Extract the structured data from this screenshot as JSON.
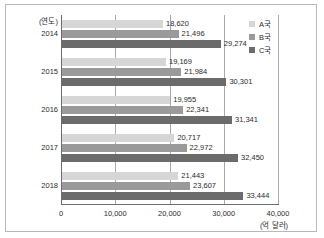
{
  "chart_data": {
    "type": "bar",
    "orientation": "horizontal",
    "title": "",
    "subtitle": "",
    "xlabel": "(억 달러)",
    "ylabel": "(연도)",
    "xlim": [
      0,
      40000
    ],
    "xticks": [
      "0",
      "10,000",
      "20,000",
      "30,000",
      "40,000"
    ],
    "xtick_values": [
      0,
      10000,
      20000,
      30000,
      40000
    ],
    "grid": true,
    "legend_position": "top-right",
    "categories": [
      "2014",
      "2015",
      "2016",
      "2017",
      "2018"
    ],
    "series": [
      {
        "name": "A국",
        "color": "#d6d6d6",
        "values": [
          18620,
          19169,
          19955,
          20717,
          21443
        ],
        "labels": [
          "18,620",
          "19,169",
          "19,955",
          "20,717",
          "21,443"
        ]
      },
      {
        "name": "B국",
        "color": "#9a9a9a",
        "values": [
          21496,
          21984,
          22341,
          22972,
          23607
        ],
        "labels": [
          "21,496",
          "21,984",
          "22,341",
          "22,972",
          "23,607"
        ]
      },
      {
        "name": "C국",
        "color": "#6b6b6b",
        "values": [
          29274,
          30301,
          31341,
          32450,
          33444
        ],
        "labels": [
          "29,274",
          "30,301",
          "31,341",
          "32,450",
          "33,444"
        ]
      }
    ]
  },
  "legend": {
    "items": [
      {
        "label": "A국",
        "color": "#d6d6d6"
      },
      {
        "label": "B국",
        "color": "#9a9a9a"
      },
      {
        "label": "C국",
        "color": "#6b6b6b"
      }
    ]
  },
  "axes": {
    "y_title": "(연도)",
    "x_unit": "(억 달러)"
  }
}
